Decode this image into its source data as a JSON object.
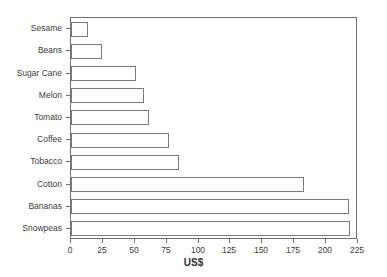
{
  "chart_data": {
    "type": "bar",
    "orientation": "horizontal",
    "title": "",
    "xlabel": "US$",
    "ylabel": "",
    "xlim": [
      0,
      225
    ],
    "ylim": [
      0,
      10
    ],
    "grid": false,
    "legend": false,
    "xticks": [
      0,
      25,
      50,
      75,
      100,
      125,
      150,
      175,
      200,
      225
    ],
    "xtick_labels": [
      "0",
      "25",
      "50",
      "75",
      "100",
      "125",
      "150",
      "175",
      "200",
      "225"
    ],
    "categories": [
      "Sesame",
      "Beans",
      "Sugar Cane",
      "Melon",
      "Tomato",
      "Coffee",
      "Tobacco",
      "Cotton",
      "Bananas",
      "Snowpeas"
    ],
    "values": [
      13,
      24,
      51,
      57,
      61,
      77,
      85,
      183,
      218,
      219
    ],
    "bar_fill_color": "#ffffff",
    "bar_edge_color": "#7a7a7a",
    "axis_color": "#6f6f6f",
    "text_color": "#3c3c3c",
    "background_color": "#ffffff"
  }
}
